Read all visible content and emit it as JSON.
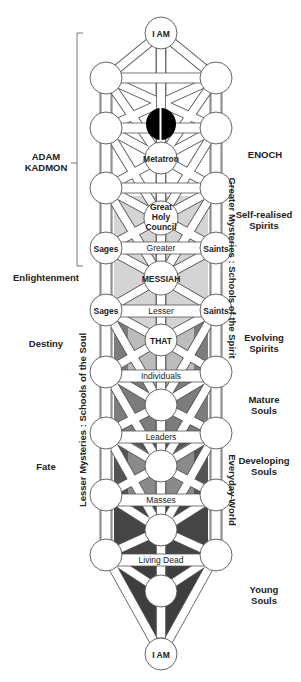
{
  "diagram": {
    "nodes": {
      "top": "I AM",
      "metatron": "Metatron",
      "council_1": "Great",
      "council_2": "Holy",
      "council_3": "Council",
      "sages_upper": "Sages",
      "saints_upper": "Saints",
      "messiah": "MESSIAH",
      "sages_lower": "Sages",
      "saints_lower": "Saints",
      "that": "THAT",
      "bottom": "I AM"
    },
    "bars": {
      "greater": "Greater",
      "lesser": "Lesser",
      "individuals": "Individuals",
      "leaders": "Leaders",
      "masses": "Masses",
      "living_dead": "Living Dead"
    },
    "left_labels": {
      "adam_1": "ADAM",
      "adam_2": "KADMON",
      "enlightenment": "Enlightenment",
      "destiny": "Destiny",
      "fate": "Fate"
    },
    "right_labels": {
      "enoch": "ENOCH",
      "self_realised_1": "Self-realised",
      "self_realised_2": "Spirits",
      "evolving_1": "Evolving",
      "evolving_2": "Spirits",
      "mature_1": "Mature",
      "mature_2": "Souls",
      "developing_1": "Developing",
      "developing_2": "Souls",
      "young_1": "Young",
      "young_2": "Souls"
    },
    "vertical_labels": {
      "greater_mysteries": "Greater Mysteries : Schools of the Spirit",
      "lesser_mysteries": "Lesser Mysteries : Schools of the Soul",
      "everyday_world": "Everyday World"
    },
    "colors": {
      "light_gray": "#d4d4d4",
      "mid_gray": "#9a9a9a",
      "dark_gray": "#6e6e6e",
      "darker_gray": "#4a4a4a",
      "darkest_gray": "#3a3a3a",
      "outline": "#555555",
      "black_dot": "#000000"
    }
  }
}
